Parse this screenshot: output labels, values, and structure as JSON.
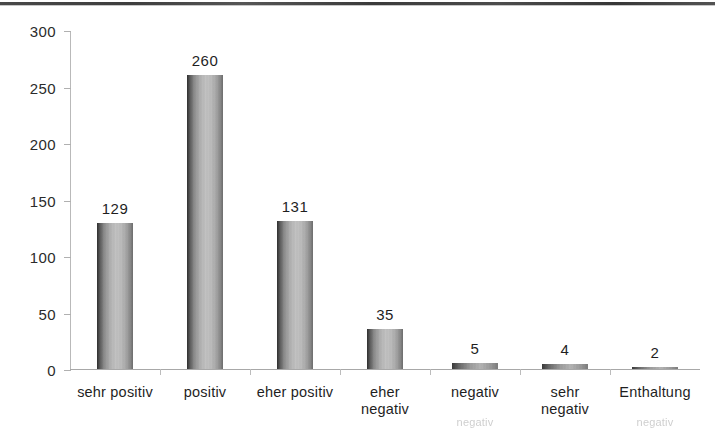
{
  "chart_data": {
    "type": "bar",
    "title": "",
    "xlabel": "",
    "ylabel": "",
    "categories": [
      "sehr positiv",
      "positiv",
      "eher positiv",
      "eher\nnegativ",
      "negativ",
      "sehr\nnegativ",
      "Enthaltung"
    ],
    "values": [
      129,
      260,
      131,
      35,
      5,
      4,
      2
    ],
    "ylim": [
      0,
      300
    ],
    "yticks": [
      0,
      50,
      100,
      150,
      200,
      250,
      300
    ],
    "ytick_labels": [
      "0",
      "50",
      "100",
      "150",
      "200",
      "250",
      "300"
    ],
    "grid": false,
    "legend": null,
    "bar_color": "#b0b0b0",
    "axis_color": "#b0b0b0",
    "background": "#ffffff"
  },
  "ghost": {
    "line_a": "negativ",
    "line_b": "negativ"
  }
}
